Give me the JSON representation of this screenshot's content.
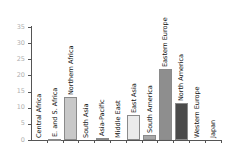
{
  "chart_data": {
    "type": "bar",
    "title": "",
    "xlabel": "",
    "ylabel": "",
    "ylim": [
      0,
      35
    ],
    "yticks": [
      0,
      5,
      10,
      15,
      20,
      25,
      30,
      35
    ],
    "grid": false,
    "legend": null,
    "categories": [
      "Central Africa",
      "E. and S. Africa",
      "Northern Africa",
      "South Asia",
      "Asia-Pacific",
      "Middle East",
      "East Asia",
      "South America",
      "Eastern Europe",
      "North America",
      "Western Europe",
      "Japan"
    ],
    "values": [
      0,
      0.4,
      13.3,
      0,
      0.5,
      0,
      7.7,
      1.7,
      22,
      11.5,
      0,
      0
    ],
    "colors": [
      "#ffffff",
      "#b5b5b5",
      "#c8c8c8",
      "#ffffff",
      "#d0d0d0",
      "#ffffff",
      "#ebebeb",
      "#a8a8a8",
      "#8e8e8e",
      "#4a4a4a",
      "#ffffff",
      "#ffffff"
    ]
  }
}
